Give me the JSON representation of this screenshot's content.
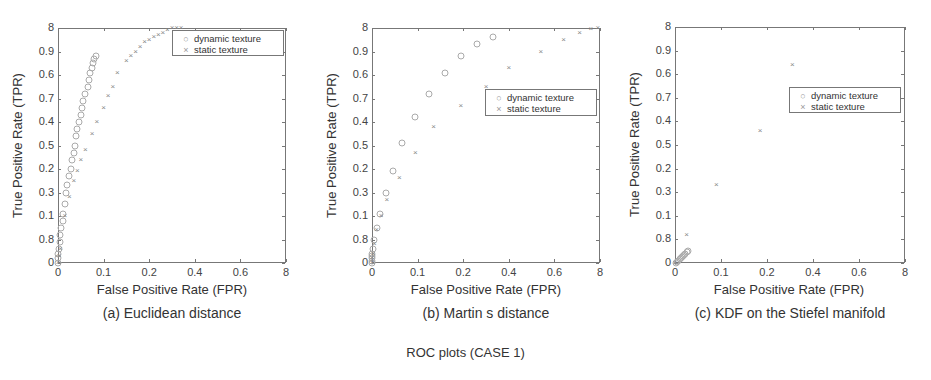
{
  "figure": {
    "caption": "ROC plots (CASE 1)"
  },
  "chart_data": [
    {
      "type": "scatter",
      "title": "(a) Euclidean distance",
      "xlabel": "False Positive Rate (FPR)",
      "ylabel": "True Positive Rate (TPR)",
      "xticks": [
        "0",
        "0.1",
        "0.2",
        "0.4",
        "0.6",
        "8"
      ],
      "yticks": [
        "0",
        "0.8",
        "0.1",
        "0.3",
        "0.2",
        "0.5",
        "0.4",
        "0.7",
        "0.6",
        "0.9",
        "8"
      ],
      "xlim": [
        0,
        1
      ],
      "ylim": [
        0,
        1
      ],
      "grid": false,
      "legend_position": "upper right",
      "box": {
        "left": 58,
        "top": 28,
        "width": 228,
        "height": 235
      },
      "legend": {
        "left": 172,
        "top": 30,
        "width": 112,
        "height": 26
      },
      "series": [
        {
          "name": "dynamic texture",
          "marker": "circle",
          "points": [
            [
              0.0,
              0.0
            ],
            [
              0.0,
              0.02
            ],
            [
              0.0,
              0.04
            ],
            [
              0.005,
              0.06
            ],
            [
              0.01,
              0.09
            ],
            [
              0.01,
              0.12
            ],
            [
              0.015,
              0.15
            ],
            [
              0.02,
              0.18
            ],
            [
              0.02,
              0.21
            ],
            [
              0.03,
              0.25
            ],
            [
              0.035,
              0.3
            ],
            [
              0.04,
              0.33
            ],
            [
              0.05,
              0.37
            ],
            [
              0.055,
              0.4
            ],
            [
              0.06,
              0.44
            ],
            [
              0.07,
              0.47
            ],
            [
              0.075,
              0.5
            ],
            [
              0.08,
              0.54
            ],
            [
              0.085,
              0.57
            ],
            [
              0.09,
              0.6
            ],
            [
              0.1,
              0.63
            ],
            [
              0.105,
              0.66
            ],
            [
              0.11,
              0.69
            ],
            [
              0.12,
              0.72
            ],
            [
              0.13,
              0.75
            ],
            [
              0.135,
              0.78
            ],
            [
              0.14,
              0.81
            ],
            [
              0.15,
              0.83
            ],
            [
              0.155,
              0.85
            ],
            [
              0.16,
              0.87
            ],
            [
              0.165,
              0.88
            ]
          ]
        },
        {
          "name": "static texture",
          "marker": "cross",
          "points": [
            [
              0.0,
              0.0
            ],
            [
              0.005,
              0.03
            ],
            [
              0.01,
              0.06
            ],
            [
              0.03,
              0.2
            ],
            [
              0.05,
              0.28
            ],
            [
              0.07,
              0.35
            ],
            [
              0.085,
              0.39
            ],
            [
              0.1,
              0.44
            ],
            [
              0.12,
              0.48
            ],
            [
              0.15,
              0.55
            ],
            [
              0.17,
              0.6
            ],
            [
              0.2,
              0.66
            ],
            [
              0.22,
              0.71
            ],
            [
              0.24,
              0.75
            ],
            [
              0.26,
              0.81
            ],
            [
              0.3,
              0.86
            ],
            [
              0.32,
              0.88
            ],
            [
              0.34,
              0.9
            ],
            [
              0.36,
              0.92
            ],
            [
              0.38,
              0.94
            ],
            [
              0.4,
              0.95
            ],
            [
              0.42,
              0.96
            ],
            [
              0.44,
              0.97
            ],
            [
              0.46,
              0.98
            ],
            [
              0.48,
              0.99
            ],
            [
              0.5,
              1.0
            ],
            [
              0.52,
              1.0
            ],
            [
              0.54,
              1.0
            ]
          ]
        }
      ]
    },
    {
      "type": "scatter",
      "title": "(b) Martin s distance",
      "xlabel": "False Positive Rate (FPR)",
      "ylabel": "True Positive Rate (TPR)",
      "xticks": [
        "0",
        "0.1",
        "0.2",
        "0.4",
        "0.6",
        "8"
      ],
      "yticks": [
        "0",
        "0.8",
        "0.1",
        "0.3",
        "0.2",
        "0.5",
        "0.4",
        "0.7",
        "0.6",
        "0.9",
        "8"
      ],
      "xlim": [
        0,
        1
      ],
      "ylim": [
        0,
        1
      ],
      "grid": false,
      "legend_position": "center right",
      "box": {
        "left": 372,
        "top": 28,
        "width": 228,
        "height": 235
      },
      "legend": {
        "left": 485,
        "top": 89,
        "width": 112,
        "height": 27
      },
      "series": [
        {
          "name": "dynamic texture",
          "marker": "circle",
          "points": [
            [
              0.0,
              0.0
            ],
            [
              0.0,
              0.01
            ],
            [
              0.0,
              0.02
            ],
            [
              0.0,
              0.03
            ],
            [
              0.0,
              0.04
            ],
            [
              0.005,
              0.06
            ],
            [
              0.01,
              0.1
            ],
            [
              0.02,
              0.15
            ],
            [
              0.035,
              0.21
            ],
            [
              0.06,
              0.3
            ],
            [
              0.09,
              0.39
            ],
            [
              0.13,
              0.51
            ],
            [
              0.19,
              0.62
            ],
            [
              0.25,
              0.72
            ],
            [
              0.32,
              0.81
            ],
            [
              0.39,
              0.88
            ],
            [
              0.46,
              0.93
            ],
            [
              0.53,
              0.96
            ]
          ]
        },
        {
          "name": "static texture",
          "marker": "cross",
          "points": [
            [
              0.0,
              0.0
            ],
            [
              0.0,
              0.01
            ],
            [
              0.0,
              0.02
            ],
            [
              0.005,
              0.04
            ],
            [
              0.01,
              0.08
            ],
            [
              0.02,
              0.14
            ],
            [
              0.04,
              0.2
            ],
            [
              0.065,
              0.27
            ],
            [
              0.12,
              0.36
            ],
            [
              0.19,
              0.47
            ],
            [
              0.27,
              0.58
            ],
            [
              0.39,
              0.67
            ],
            [
              0.5,
              0.75
            ],
            [
              0.6,
              0.83
            ],
            [
              0.74,
              0.9
            ],
            [
              0.84,
              0.95
            ],
            [
              0.91,
              0.98
            ],
            [
              0.96,
              0.995
            ],
            [
              0.99,
              1.0
            ]
          ]
        }
      ]
    },
    {
      "type": "scatter",
      "title": "(c) KDF on the Stiefel manifold",
      "xlabel": "False Positive Rate (FPR)",
      "ylabel": "True Positive Rate (TPR)",
      "xticks": [
        "0",
        "0.1",
        "0.2",
        "0.4",
        "0.6",
        "8"
      ],
      "yticks": [
        "0",
        "0.8",
        "0.1",
        "0.3",
        "0.2",
        "0.5",
        "0.4",
        "0.7",
        "0.6",
        "0.9",
        "8"
      ],
      "xlim": [
        0,
        1
      ],
      "ylim": [
        0,
        1
      ],
      "grid": false,
      "legend_position": "center right",
      "box": {
        "left": 675,
        "top": 27,
        "width": 230,
        "height": 236
      },
      "legend": {
        "left": 789,
        "top": 87,
        "width": 112,
        "height": 26
      },
      "series": [
        {
          "name": "dynamic texture",
          "marker": "circle",
          "points": [
            [
              0.005,
              0.0
            ],
            [
              0.01,
              0.005
            ],
            [
              0.015,
              0.01
            ],
            [
              0.02,
              0.015
            ],
            [
              0.025,
              0.02
            ],
            [
              0.03,
              0.025
            ],
            [
              0.035,
              0.03
            ],
            [
              0.04,
              0.035
            ],
            [
              0.045,
              0.04
            ],
            [
              0.05,
              0.045
            ],
            [
              0.055,
              0.05
            ]
          ]
        },
        {
          "name": "static texture",
          "marker": "cross",
          "points": [
            [
              0.0,
              0.0
            ],
            [
              0.05,
              0.12
            ],
            [
              0.18,
              0.33
            ],
            [
              0.37,
              0.56
            ],
            [
              0.51,
              0.84
            ]
          ]
        }
      ]
    }
  ]
}
